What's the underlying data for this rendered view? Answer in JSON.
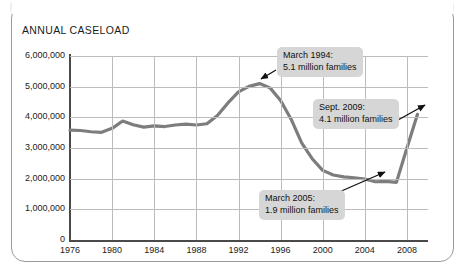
{
  "chart_title": "ANNUAL CASELOAD",
  "chart_data": {
    "type": "line",
    "title": "ANNUAL CASELOAD",
    "xlabel": "",
    "ylabel": "",
    "grid": true,
    "legend": "none",
    "xlim": [
      1976,
      2010
    ],
    "ylim": [
      0,
      6000000
    ],
    "x_ticks": [
      "1976",
      "1980",
      "1984",
      "1988",
      "1992",
      "1996",
      "2000",
      "2004",
      "2008"
    ],
    "y_ticks": [
      "0",
      "1,000,000",
      "2,000,000",
      "3,000,000",
      "4,000,000",
      "5,000,000",
      "6,000,000"
    ],
    "series": [
      {
        "name": "Annual caseload (families)",
        "color": "#7d7d7d",
        "x": [
          1976,
          1977,
          1978,
          1979,
          1980,
          1981,
          1982,
          1983,
          1984,
          1985,
          1986,
          1987,
          1988,
          1989,
          1990,
          1991,
          1992,
          1993,
          1994,
          1995,
          1996,
          1997,
          1998,
          1999,
          2000,
          2001,
          2002,
          2003,
          2004,
          2005,
          2006,
          2007,
          2008,
          2009
        ],
        "values": [
          3580000,
          3570000,
          3530000,
          3510000,
          3640000,
          3880000,
          3760000,
          3680000,
          3720000,
          3700000,
          3750000,
          3780000,
          3750000,
          3790000,
          4060000,
          4470000,
          4830000,
          5010000,
          5100000,
          4960000,
          4550000,
          3940000,
          3170000,
          2650000,
          2270000,
          2120000,
          2060000,
          2030000,
          1990000,
          1900000,
          1910000,
          1880000,
          3000000,
          4100000
        ]
      }
    ],
    "annotations": [
      {
        "id": "march-1994",
        "label_line1": "March 1994:",
        "label_line2": "5.1 million families",
        "point_x": 1994,
        "point_y": 5100000
      },
      {
        "id": "sept-2009",
        "label_line1": "Sept. 2009:",
        "label_line2": "4.1 million families",
        "point_x": 2009,
        "point_y": 4100000
      },
      {
        "id": "march-2005",
        "label_line1": "March 2005:",
        "label_line2": "1.9 million families",
        "point_x": 2005,
        "point_y": 1900000
      }
    ]
  }
}
